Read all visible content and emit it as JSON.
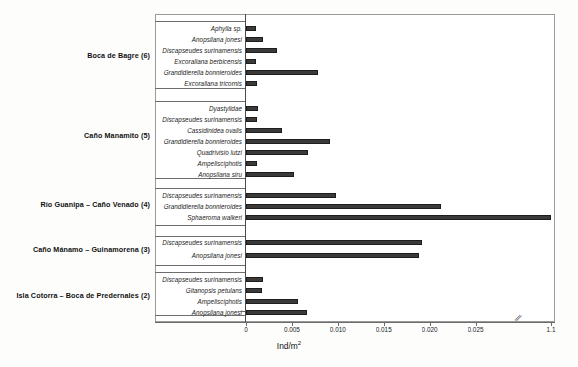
{
  "chart_data": {
    "type": "bar",
    "orientation": "horizontal",
    "title": "",
    "xlabel": "Ind/m2",
    "xlabel_display": "Ind/m",
    "xlabel_exponent": "2",
    "ylabel": "",
    "grid": false,
    "legend": "none",
    "axis_break": true,
    "axis_break_symbol": "//",
    "xlim": [
      0,
      0.026
    ],
    "xlim_after_break": [
      1.05,
      1.12
    ],
    "xticks": [
      0,
      0.005,
      0.01,
      0.015,
      0.02,
      0.025,
      1.1
    ],
    "xticklabels": [
      "0",
      "0.00",
      "0.0",
      "0.01",
      "0.0",
      "0.02",
      "0.0",
      "1.1"
    ],
    "xticklabels_full": [
      "0",
      "0.005",
      "0.010",
      "0.015",
      "0.020",
      "0.025",
      "1.1"
    ],
    "groups": [
      {
        "name": "Boca de Bagre (6)",
        "categories": [
          "Aphylla sp.",
          "Anopsilana jonesi",
          "Discapseudes surinamensis",
          "Excorallana berbicensis",
          "Grandidierella bonnieroides",
          "Excorallana tricornis"
        ],
        "values": [
          0.0011,
          0.0019,
          0.0034,
          0.0011,
          0.0078,
          0.0012
        ]
      },
      {
        "name": "Caño Manamito (5)",
        "categories": [
          "Dyastylidae",
          "Discapseudes surinamensis",
          "Cassidinidea ovalis",
          "Grandidierella bonnieroides",
          "Quadrivisio lutzi",
          "Ampelisciphotis",
          "Anopsilana siru"
        ],
        "values": [
          0.0013,
          0.0012,
          0.0039,
          0.0091,
          0.0068,
          0.0012,
          0.0052
        ]
      },
      {
        "name": "Río Guanipa – Caño Venado (4)",
        "categories": [
          "Discapseudes surinamensis",
          "Grandidierella bonnieroides",
          "Sphaeroma walkeri"
        ],
        "values": [
          0.0098,
          0.0212,
          1.105
        ]
      },
      {
        "name": "Caño Mánamo – Guinamorena (3)",
        "categories": [
          "Discapseudes surinamensis",
          "Anopsilana jonesi"
        ],
        "values": [
          0.0192,
          0.0188
        ]
      },
      {
        "name": "Isla Cotorra – Boca de Predernales (2)",
        "categories": [
          "Discapseudes surinamensis",
          "Gitanopsis petulans",
          "Ampelisciphotis",
          "Anopsilana jonesi"
        ],
        "values": [
          0.0019,
          0.0017,
          0.0057,
          0.0066
        ]
      }
    ]
  },
  "axis": {
    "title_main": "Ind/m",
    "title_sup": "2"
  }
}
